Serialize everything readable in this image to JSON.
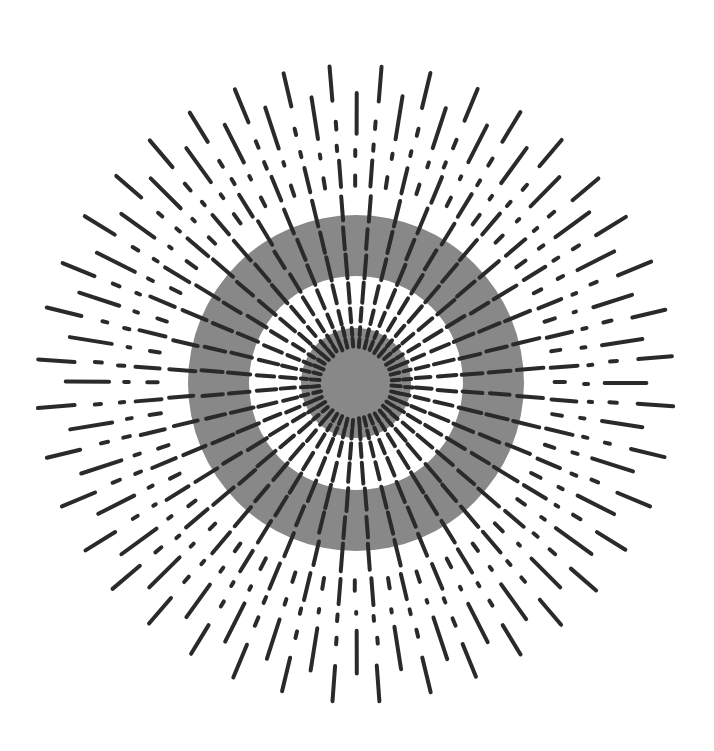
{
  "artwork": {
    "width": 714,
    "height": 751,
    "background": "#ffffff",
    "center": {
      "x": 356,
      "y": 383
    },
    "colors": {
      "gray": "#888888",
      "white": "#ffffff",
      "stroke": "#2a2a2a"
    },
    "discs": [
      {
        "name": "outer-gray-ring",
        "radius": 168,
        "fill": "gray"
      },
      {
        "name": "white-ring",
        "radius": 107,
        "fill": "white"
      },
      {
        "name": "center-gray-disc",
        "radius": 55,
        "fill": "gray"
      }
    ],
    "rays": {
      "primary": {
        "count": 40,
        "angle_offset_deg": 4.5,
        "stroke_width": 4,
        "segments": [
          [
            36,
            45
          ],
          [
            48,
            56
          ],
          [
            61,
            75
          ],
          [
            81,
            100
          ],
          [
            106,
            128
          ],
          [
            134,
            155
          ],
          [
            162,
            188
          ],
          [
            196,
            222
          ],
          [
            233,
            238
          ],
          [
            255,
            262
          ],
          [
            283,
            318
          ]
        ]
      },
      "secondary": {
        "count": 40,
        "angle_offset_deg": 0,
        "stroke_width": 4,
        "min_radius": 170,
        "segments": [
          [
            198,
            208
          ],
          [
            228,
            232
          ],
          [
            248,
            290
          ]
        ]
      },
      "jitter": 0.6
    }
  }
}
